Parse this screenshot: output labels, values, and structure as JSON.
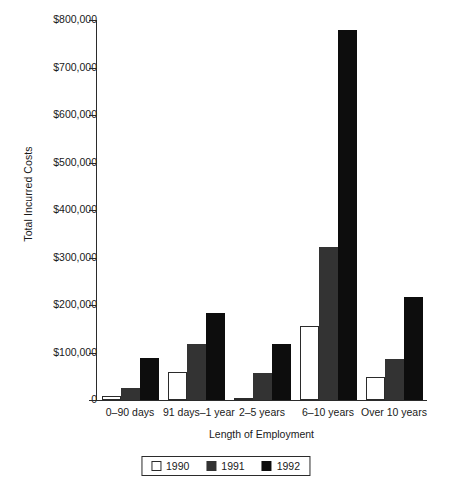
{
  "chart_data": {
    "type": "bar",
    "title": "",
    "xlabel": "Length of Employment",
    "ylabel": "Total Incurred Costs",
    "categories": [
      "0–90 days",
      "91 days–1 year",
      "2–5 years",
      "6–10 years",
      "Over 10 years"
    ],
    "series": [
      {
        "name": "1990",
        "color": "#ffffff",
        "values": [
          8000,
          60000,
          5000,
          155000,
          48000
        ]
      },
      {
        "name": "1991",
        "color": "#333333",
        "values": [
          25000,
          118000,
          57000,
          322000,
          86000
        ]
      },
      {
        "name": "1992",
        "color": "#0d0d0d",
        "values": [
          88000,
          183000,
          118000,
          780000,
          217000
        ]
      }
    ],
    "ylim": [
      0,
      800000
    ],
    "ytick_values": [
      0,
      100000,
      200000,
      300000,
      400000,
      500000,
      600000,
      700000,
      800000
    ],
    "ytick_labels": [
      "0",
      "$100,000",
      "$200,000",
      "$300,000",
      "$400,000",
      "$500,000",
      "$600,000",
      "$700,000",
      "$800,000"
    ],
    "grid": false,
    "legend_position": "bottom-center",
    "legend_entries": [
      "1990",
      "1991",
      "1992"
    ]
  }
}
